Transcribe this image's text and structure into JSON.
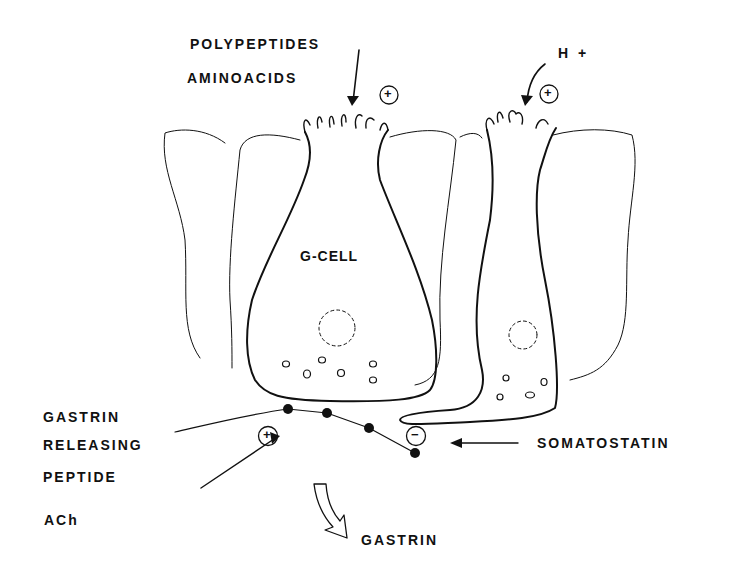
{
  "diagram": {
    "labels": {
      "polypeptides": "POLYPEPTIDES",
      "aminoacids": "AMINOACIDS",
      "h_plus": "H +",
      "g_cell": "G-CELL",
      "grp_line1": "GASTRIN",
      "grp_line2": "RELEASING",
      "grp_line3": "PEPTIDE",
      "ach": "ACh",
      "somatostatin": "SOMATOSTATIN",
      "gastrin_out": "GASTRIN"
    },
    "signs": {
      "stim_luminal": "+",
      "stim_acid": "+",
      "stim_grp": "+",
      "inhib_somatostatin": "−"
    },
    "colors": {
      "ink": "#111111",
      "background": "#ffffff"
    }
  }
}
